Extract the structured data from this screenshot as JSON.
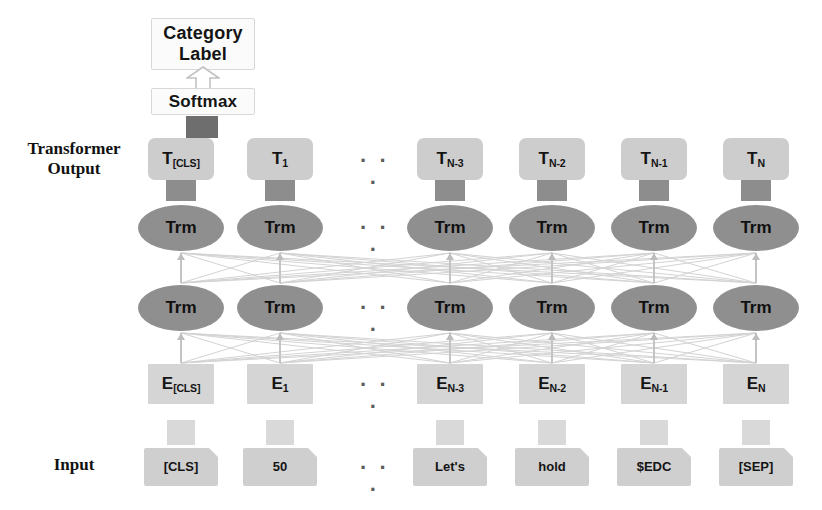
{
  "figure": {
    "type": "bert-architecture-diagram",
    "colors": {
      "trm_fill": "#8f8f8f",
      "t_box_fill": "#cdcdcd",
      "e_box_fill": "#d5d5d5",
      "input_box_fill": "#cfcfcf",
      "white_box_fill": "#fbfbfb",
      "arrow_dark": "#6e6e6e",
      "arrow_mid": "#8d8d8d",
      "arrow_light": "#d9d9d9",
      "mesh_line": "#d0d0d0",
      "text": "#141414",
      "background": "#ffffff"
    }
  },
  "side_labels": {
    "transformer_output": "Transformer\nOutput",
    "transformer_output_line1": "Transformer",
    "transformer_output_line2": "Output",
    "input": "Input"
  },
  "head": {
    "category_label_line1": "Category",
    "category_label_line2": "Label",
    "softmax": "Softmax"
  },
  "ellipsis": "· · ·",
  "columns": [
    {
      "id": "cls",
      "x": 148,
      "output_base": "T",
      "output_sub": "[CLS]",
      "embedding_base": "E",
      "embedding_sub": "[CLS]",
      "token": "[CLS]"
    },
    {
      "id": "tok1",
      "x": 247,
      "output_base": "T",
      "output_sub": "1",
      "embedding_base": "E",
      "embedding_sub": "1",
      "token": "50"
    },
    {
      "id": "n3",
      "x": 417,
      "output_base": "T",
      "output_sub": "N-3",
      "embedding_base": "E",
      "embedding_sub": "N-3",
      "token": "Let's"
    },
    {
      "id": "n2",
      "x": 519,
      "output_base": "T",
      "output_sub": "N-2",
      "embedding_base": "E",
      "embedding_sub": "N-2",
      "token": "hold"
    },
    {
      "id": "n1",
      "x": 621,
      "output_base": "T",
      "output_sub": "N-1",
      "embedding_base": "E",
      "embedding_sub": "N-1",
      "token": "$EDC"
    },
    {
      "id": "n",
      "x": 723,
      "output_base": "T",
      "output_sub": "N",
      "embedding_base": "E",
      "embedding_sub": "N",
      "token": "[SEP]"
    }
  ],
  "layers": {
    "trm_label": "Trm",
    "trm_row_count": 2
  }
}
